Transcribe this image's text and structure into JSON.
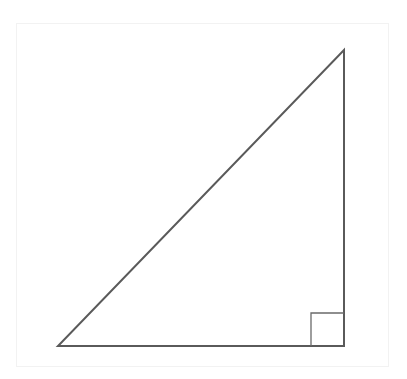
{
  "diagram": {
    "type": "right-triangle",
    "stroke_color": "#5a5a5a",
    "frame_color": "#f2f2f2",
    "vertices": {
      "top": [
        344,
        50
      ],
      "bottom_right": [
        344,
        346
      ],
      "bottom_left": [
        58,
        346
      ]
    },
    "right_angle_marker": {
      "corner": "bottom_right",
      "size": 33
    },
    "labels": []
  }
}
